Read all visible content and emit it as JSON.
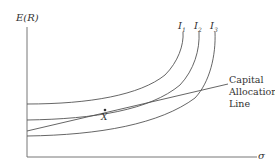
{
  "diagram": {
    "y_axis_label": "E(R)",
    "x_axis_label": "σ",
    "curves": [
      {
        "label": "I",
        "subscript": "1"
      },
      {
        "label": "I",
        "subscript": "2"
      },
      {
        "label": "I",
        "subscript": "3"
      }
    ],
    "line_label": [
      "Capital",
      "Allocation",
      "Line"
    ],
    "point_label": "X",
    "colors": {
      "stroke": "#555555",
      "text": "#333333"
    }
  }
}
